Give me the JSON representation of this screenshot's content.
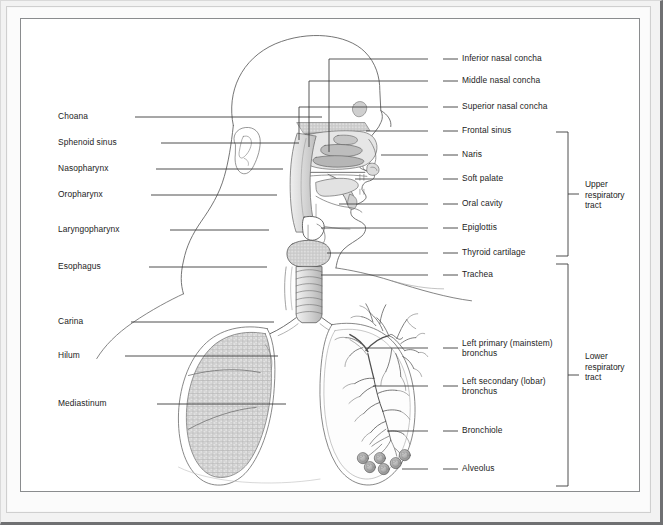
{
  "figure": {
    "type": "anatomical-diagram",
    "background_color": "#ffffff",
    "frame_color": "#8a8c8e",
    "mat_color": "#f2f2f2",
    "line_color": "#3a3a3a",
    "text_color": "#1c1c1c"
  },
  "labels_left": [
    {
      "id": "choana",
      "text": "Choana",
      "x": 37,
      "y": 98,
      "line_to_x": 301,
      "line_to_y": 98
    },
    {
      "id": "sphenoid-sinus",
      "text": "Sphenoid sinus",
      "x": 37,
      "y": 124,
      "line_to_x": 278,
      "line_to_y": 124
    },
    {
      "id": "nasopharynx",
      "text": "Nasopharynx",
      "x": 37,
      "y": 150,
      "line_to_x": 262,
      "line_to_y": 150
    },
    {
      "id": "oropharynx",
      "text": "Oropharynx",
      "x": 37,
      "y": 176,
      "line_to_x": 256,
      "line_to_y": 176
    },
    {
      "id": "laryngopharynx",
      "text": "Laryngopharynx",
      "x": 37,
      "y": 211,
      "line_to_x": 248,
      "line_to_y": 211
    },
    {
      "id": "esophagus",
      "text": "Esophagus",
      "x": 37,
      "y": 248,
      "line_to_x": 246,
      "line_to_y": 248
    },
    {
      "id": "carina",
      "text": "Carina",
      "x": 37,
      "y": 303,
      "line_to_x": 253,
      "line_to_y": 303
    },
    {
      "id": "hilum",
      "text": "Hilum",
      "x": 37,
      "y": 337,
      "line_to_x": 257,
      "line_to_y": 337
    },
    {
      "id": "mediastinum",
      "text": "Mediastinum",
      "x": 37,
      "y": 385,
      "line_to_x": 265,
      "line_to_y": 385
    }
  ],
  "labels_right": [
    {
      "id": "inferior-nasal-concha",
      "text": "Inferior nasal concha",
      "x": 441,
      "y": 40,
      "line_from_x": 422,
      "line_from_y": 40
    },
    {
      "id": "middle-nasal-concha",
      "text": "Middle nasal concha",
      "x": 441,
      "y": 62,
      "line_from_x": 422,
      "line_from_y": 62
    },
    {
      "id": "superior-nasal-concha",
      "text": "Superior nasal concha",
      "x": 441,
      "y": 88,
      "line_from_x": 422,
      "line_from_y": 88
    },
    {
      "id": "frontal-sinus",
      "text": "Frontal sinus",
      "x": 441,
      "y": 112,
      "line_from_x": 422,
      "line_from_y": 112
    },
    {
      "id": "naris",
      "text": "Naris",
      "x": 441,
      "y": 136,
      "line_from_x": 422,
      "line_from_y": 136
    },
    {
      "id": "soft-palate",
      "text": "Soft palate",
      "x": 441,
      "y": 160,
      "line_from_x": 422,
      "line_from_y": 160
    },
    {
      "id": "oral-cavity",
      "text": "Oral cavity",
      "x": 441,
      "y": 185,
      "line_from_x": 422,
      "line_from_y": 185
    },
    {
      "id": "epiglottis",
      "text": "Epiglottis",
      "x": 441,
      "y": 209,
      "line_from_x": 422,
      "line_from_y": 209
    },
    {
      "id": "thyroid-cartilage",
      "text": "Thyroid cartilage",
      "x": 441,
      "y": 234,
      "line_from_x": 422,
      "line_from_y": 234
    },
    {
      "id": "trachea",
      "text": "Trachea",
      "x": 441,
      "y": 256,
      "line_from_x": 422,
      "line_from_y": 256
    },
    {
      "id": "left-primary-bronchus",
      "text": "Left primary (mainstem)\nbronchus",
      "x": 441,
      "y": 325,
      "line_from_x": 422,
      "line_from_y": 329
    },
    {
      "id": "left-secondary-bronchus",
      "text": "Left secondary (lobar)\nbronchus",
      "x": 441,
      "y": 363,
      "line_from_x": 422,
      "line_from_y": 367
    },
    {
      "id": "bronchiole",
      "text": "Bronchiole",
      "x": 441,
      "y": 412,
      "line_from_x": 422,
      "line_from_y": 412
    },
    {
      "id": "alveolus",
      "text": "Alveolus",
      "x": 441,
      "y": 450,
      "line_from_x": 422,
      "line_from_y": 450
    }
  ],
  "tracts": [
    {
      "id": "upper-respiratory-tract",
      "text": "Upper\nrespiratory\ntract",
      "bracket_x": 547,
      "bracket_top": 113,
      "bracket_bottom": 237,
      "text_x": 564,
      "text_y": 176
    },
    {
      "id": "lower-respiratory-tract",
      "text": "Lower\nrespiratory\ntract",
      "bracket_x": 547,
      "bracket_top": 245,
      "bracket_bottom": 467,
      "text_x": 564,
      "text_y": 348
    }
  ]
}
